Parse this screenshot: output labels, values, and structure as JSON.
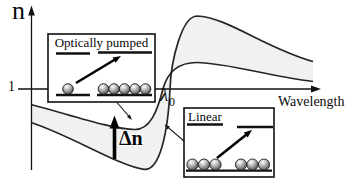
{
  "figure": {
    "y_axis_label": "n",
    "y_tick_label": "1",
    "x_axis_label": "Wavelength",
    "resonance_symbol": "λ",
    "resonance_sub": "0",
    "delta_n_label": "Δn",
    "inset_pumped_title": "Optically pumped",
    "inset_linear_title": "Linear",
    "colors": {
      "band_fill": "#f1f1f1",
      "ink": "#1a1a1a",
      "background": "#ffffff"
    }
  }
}
